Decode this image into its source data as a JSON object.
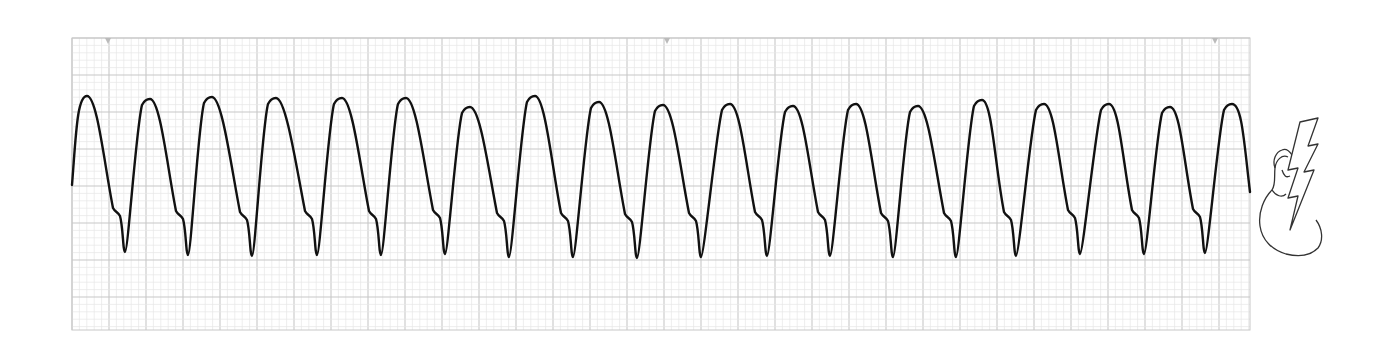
{
  "figure": {
    "type": "ecg-rhythm-strip",
    "background": "#ffffff",
    "grid": {
      "x0": 72,
      "y0": 38,
      "x1": 1250,
      "y1": 330,
      "minor_px": 7.4,
      "major_every": 5,
      "minor_color": "#e6e6e6",
      "major_color": "#c8c8c8"
    },
    "top_markers_x": [
      108,
      667,
      1215
    ],
    "marker_color": "#bbbbbb",
    "trace": {
      "color": "#111111",
      "width": 2.4,
      "start_x": 72,
      "start_y": 185,
      "beats": [
        {
          "peak_x": 87,
          "peak_y": 96,
          "trough_x": 125,
          "trough_y": 252
        },
        {
          "peak_x": 150,
          "peak_y": 99,
          "trough_x": 188,
          "trough_y": 255
        },
        {
          "peak_x": 212,
          "peak_y": 97,
          "trough_x": 252,
          "trough_y": 256
        },
        {
          "peak_x": 276,
          "peak_y": 98,
          "trough_x": 317,
          "trough_y": 255
        },
        {
          "peak_x": 342,
          "peak_y": 98,
          "trough_x": 381,
          "trough_y": 255
        },
        {
          "peak_x": 406,
          "peak_y": 98,
          "trough_x": 445,
          "trough_y": 254
        },
        {
          "peak_x": 470,
          "peak_y": 107,
          "trough_x": 509,
          "trough_y": 257
        },
        {
          "peak_x": 535,
          "peak_y": 96,
          "trough_x": 573,
          "trough_y": 257
        },
        {
          "peak_x": 599,
          "peak_y": 102,
          "trough_x": 637,
          "trough_y": 258
        },
        {
          "peak_x": 663,
          "peak_y": 105,
          "trough_x": 701,
          "trough_y": 257
        },
        {
          "peak_x": 730,
          "peak_y": 104,
          "trough_x": 767,
          "trough_y": 256
        },
        {
          "peak_x": 793,
          "peak_y": 106,
          "trough_x": 830,
          "trough_y": 256
        },
        {
          "peak_x": 856,
          "peak_y": 104,
          "trough_x": 893,
          "trough_y": 257
        },
        {
          "peak_x": 918,
          "peak_y": 106,
          "trough_x": 956,
          "trough_y": 257
        },
        {
          "peak_x": 982,
          "peak_y": 100,
          "trough_x": 1016,
          "trough_y": 256
        },
        {
          "peak_x": 1044,
          "peak_y": 104,
          "trough_x": 1080,
          "trough_y": 254
        },
        {
          "peak_x": 1109,
          "peak_y": 104,
          "trough_x": 1144,
          "trough_y": 254
        },
        {
          "peak_x": 1170,
          "peak_y": 107,
          "trough_x": 1205,
          "trough_y": 253
        },
        {
          "peak_x": 1232,
          "peak_y": 104,
          "trough_x": null,
          "trough_y": null
        }
      ],
      "end_x": 1250,
      "end_y": 192
    },
    "icon": {
      "name": "heart-with-lightning-bolt-icon",
      "meaning": "defibrillation / shockable rhythm",
      "x": 1256,
      "y": 118,
      "w": 70,
      "h": 140
    }
  }
}
